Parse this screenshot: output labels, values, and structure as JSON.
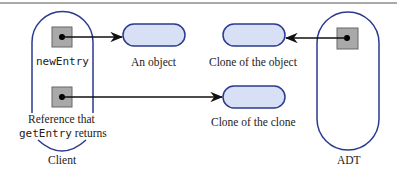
{
  "diagram": {
    "labels": {
      "new_entry": "newEntry",
      "an_object": "An object",
      "clone_of_object": "Clone of the object",
      "clone_of_clone": "Clone of the clone",
      "reference_line1": "Reference that",
      "reference_code": "getEntry",
      "reference_suffix": "returns",
      "client": "Client",
      "adt": "ADT"
    },
    "colors": {
      "outline": "#2b3a8f",
      "pill_fill": "#d8e0f5",
      "box_fill": "#a9a9a9",
      "arrow": "#111111"
    }
  }
}
